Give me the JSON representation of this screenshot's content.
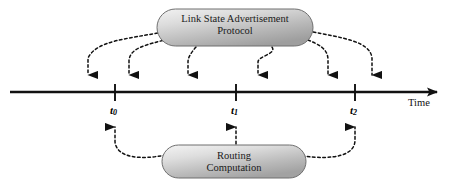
{
  "diagram": {
    "background_color": "#ffffff",
    "axis": {
      "label": "Time",
      "line_color": "#111111",
      "start_x": 10,
      "end_x": 445,
      "y": 92
    },
    "nodes": [
      {
        "id": "lsa",
        "name": "link-state-advertisement-capsule",
        "line1": "Link State Advertisement",
        "line2": "Protocol",
        "x": 157,
        "y": 9,
        "width": 156,
        "height": 37,
        "fill_light": "#e9e9e9",
        "fill_dark": "#a9a9a9",
        "border_color": "#6f6f6f"
      },
      {
        "id": "routing",
        "name": "routing-computation-capsule",
        "line1": "Routing",
        "line2": "Computation",
        "x": 162,
        "y": 145,
        "width": 144,
        "height": 33,
        "fill_light": "#ececec",
        "fill_dark": "#a9a9a9",
        "border_color": "#6f6f6f"
      }
    ],
    "ticks": [
      {
        "id": "t0",
        "label": "t",
        "subscript": "0",
        "x": 115
      },
      {
        "id": "t1",
        "label": "t",
        "subscript": "1",
        "x": 236
      },
      {
        "id": "t2",
        "label": "t",
        "subscript": "2",
        "x": 355
      }
    ],
    "down_arrow_targets": [
      88,
      129,
      188,
      258,
      328,
      372
    ],
    "up_arrow_targets": [
      115,
      236,
      355
    ],
    "edge_style": {
      "stroke_color": "#111111",
      "dash": "2.6 2.6",
      "width": 1.5
    }
  }
}
